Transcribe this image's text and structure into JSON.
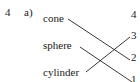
{
  "exercise": {
    "number": "4",
    "part": "a)",
    "left_items": [
      {
        "label": "cone",
        "matches": "2"
      },
      {
        "label": "sphere",
        "matches": "1"
      },
      {
        "label": "cylinder",
        "matches": "3"
      }
    ],
    "right_items": [
      "4",
      "3",
      "2",
      "1"
    ]
  }
}
